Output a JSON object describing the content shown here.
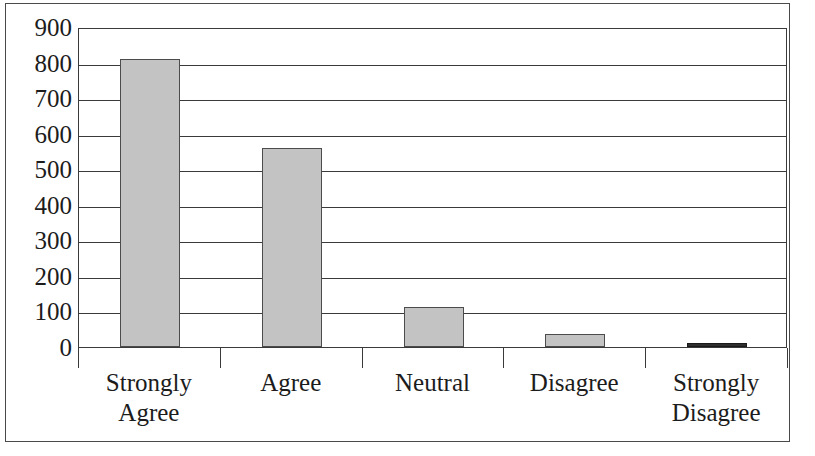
{
  "chart_data": {
    "type": "bar",
    "title": "",
    "subtitle": "",
    "xlabel": "",
    "ylabel": "",
    "categories": [
      "Strongly Agree",
      "Agree",
      "Neutral",
      "Disagree",
      "Strongly Disagree"
    ],
    "category_lines": [
      [
        "Strongly",
        "Agree"
      ],
      [
        "Agree"
      ],
      [
        "Neutral"
      ],
      [
        "Disagree"
      ],
      [
        "Strongly",
        "Disagree"
      ]
    ],
    "values": [
      810,
      560,
      113,
      38,
      5
    ],
    "ylim": [
      0,
      900
    ],
    "ytick_labels": [
      "900",
      "800",
      "700",
      "600",
      "500",
      "400",
      "300",
      "200",
      "100",
      "0"
    ],
    "ytick_values": [
      900,
      800,
      700,
      600,
      500,
      400,
      300,
      200,
      100,
      0
    ],
    "grid": true,
    "grid_axis": "y",
    "legend": false,
    "legend_position": "none",
    "bar_fill_color": "#c3c3c3",
    "bar_edge_color": "#4c4c4c",
    "tiny_bar_color": "#2e2e2e",
    "axis_color": "#3a3a3a",
    "frame_color": "#4a4a4a",
    "background_color": "#ffffff",
    "annotations": []
  }
}
